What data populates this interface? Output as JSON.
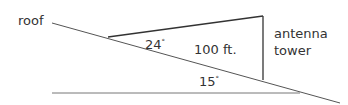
{
  "diagram": {
    "labels": {
      "roof": "roof",
      "antenna_line1": "antenna",
      "antenna_line2": "tower",
      "distance": "100 ft.",
      "angle_top": "24",
      "angle_bottom": "15",
      "degree_symbol": "°"
    },
    "colors": {
      "line": "#555555",
      "text": "#333333",
      "background": "#ffffff"
    }
  }
}
